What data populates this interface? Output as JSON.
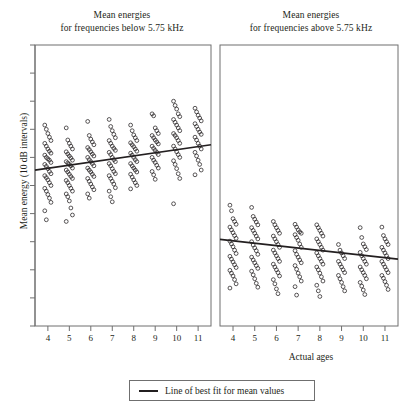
{
  "figure": {
    "y_axis_label": "Mean energy (10 dB intervals)",
    "x_axis_label": "Actual ages",
    "legend": {
      "label": "Line of best fit for mean values",
      "line_color": "#231f20"
    }
  },
  "panels": {
    "left": {
      "title_line1": "Mean energies",
      "title_line2": "for frequencies below 5.75 kHz"
    },
    "right": {
      "title_line1": "Mean energies",
      "title_line2": "for frequencies above 5.75 kHz"
    }
  },
  "chart_data": {
    "type": "scatter",
    "xlabel": "Actual ages",
    "ylabel": "Mean energy (10 dB intervals)",
    "xlim": [
      3.4,
      11.6
    ],
    "ylim": [
      0,
      10
    ],
    "xticks": [
      4,
      5,
      6,
      7,
      8,
      9,
      10,
      11
    ],
    "yticks": [
      0,
      1,
      2,
      3,
      4,
      5,
      6,
      7,
      8,
      9,
      10
    ],
    "ytick_labels": [],
    "grid": false,
    "legend_position": "bottom-center",
    "marker": "open-circle",
    "marker_color": "#231f20",
    "panels": [
      {
        "name": "below-5.75-kHz",
        "title": "Mean energies for frequencies below 5.75 kHz",
        "fit_line": {
          "label": "Line of best fit for mean values",
          "x_start": 3.4,
          "y_start": 5.55,
          "x_end": 11.6,
          "y_end": 6.45,
          "slope": 0.11,
          "intercept": 5.18
        },
        "series": [
          {
            "x": 4,
            "values": [
              7.15,
              7.0,
              6.85,
              6.72,
              6.6,
              6.5,
              6.4,
              6.3,
              6.22,
              6.15,
              6.08,
              6.0,
              5.95,
              5.9,
              5.82,
              5.75,
              5.68,
              5.6,
              5.5,
              5.42,
              5.35,
              5.28,
              5.2,
              5.1,
              5.0,
              4.9,
              4.8,
              4.68,
              4.55,
              4.4,
              4.1,
              3.78
            ]
          },
          {
            "x": 5,
            "values": [
              7.05,
              6.62,
              6.5,
              6.4,
              6.3,
              6.2,
              6.12,
              6.05,
              5.98,
              5.9,
              5.85,
              5.8,
              5.75,
              5.7,
              5.62,
              5.55,
              5.48,
              5.4,
              5.32,
              5.25,
              5.18,
              5.1,
              5.0,
              4.9,
              4.8,
              4.7,
              4.6,
              4.45,
              4.2,
              3.95,
              3.72
            ]
          },
          {
            "x": 6,
            "values": [
              7.28,
              6.78,
              6.65,
              6.55,
              6.45,
              6.35,
              6.28,
              6.2,
              6.12,
              6.05,
              6.0,
              5.92,
              5.85,
              5.78,
              5.7,
              5.62,
              5.55,
              5.48,
              5.4,
              5.32,
              5.25,
              5.15,
              5.05,
              4.95,
              4.85,
              4.7,
              4.55
            ]
          },
          {
            "x": 7,
            "values": [
              7.35,
              7.1,
              6.95,
              6.82,
              6.7,
              6.6,
              6.5,
              6.4,
              6.32,
              6.25,
              6.18,
              6.1,
              6.0,
              5.92,
              5.85,
              5.78,
              5.7,
              5.6,
              5.5,
              5.42,
              5.35,
              5.25,
              5.15,
              5.05,
              4.92,
              4.8,
              4.6,
              4.42
            ]
          },
          {
            "x": 8,
            "values": [
              7.15,
              6.95,
              6.8,
              6.7,
              6.6,
              6.52,
              6.45,
              6.38,
              6.3,
              6.22,
              6.15,
              6.08,
              6.0,
              5.92,
              5.85,
              5.78,
              5.7,
              5.62,
              5.55,
              5.48,
              5.4,
              5.3,
              5.2,
              5.1,
              5.0,
              4.88
            ]
          },
          {
            "x": 9,
            "values": [
              7.55,
              7.48,
              7.05,
              6.95,
              6.85,
              6.78,
              6.7,
              6.62,
              6.55,
              6.48,
              6.4,
              6.32,
              6.25,
              6.18,
              6.1,
              6.0,
              5.9,
              5.82,
              5.72,
              5.62,
              5.5,
              5.38,
              5.22
            ]
          },
          {
            "x": 10,
            "values": [
              8.0,
              7.85,
              7.72,
              7.55,
              7.45,
              7.35,
              7.25,
              7.15,
              7.05,
              6.95,
              6.85,
              6.78,
              6.7,
              6.6,
              6.5,
              6.4,
              6.3,
              6.2,
              6.1,
              6.0,
              5.88,
              5.75,
              5.6,
              5.42,
              5.25,
              4.35
            ]
          },
          {
            "x": 11,
            "values": [
              7.75,
              7.62,
              7.5,
              7.4,
              7.3,
              7.2,
              7.1,
              7.0,
              6.9,
              6.82,
              6.72,
              6.62,
              6.5,
              6.4,
              6.3,
              6.18,
              6.05,
              5.9,
              5.75,
              5.55,
              5.38
            ]
          }
        ]
      },
      {
        "name": "above-5.75-kHz",
        "title": "Mean energies for frequencies above 5.75 kHz",
        "fit_line": {
          "label": "Line of best fit for mean values",
          "x_start": 3.4,
          "y_start": 3.08,
          "x_end": 11.6,
          "y_end": 2.38,
          "slope": -0.085,
          "intercept": 3.37
        },
        "series": [
          {
            "x": 4,
            "values": [
              4.3,
              4.1,
              3.82,
              3.72,
              3.62,
              3.52,
              3.42,
              3.32,
              3.22,
              3.12,
              3.02,
              2.92,
              2.82,
              2.7,
              2.58,
              2.48,
              2.38,
              2.28,
              2.18,
              2.08,
              1.98,
              1.88,
              1.78,
              1.65,
              1.5,
              1.35
            ]
          },
          {
            "x": 5,
            "values": [
              4.22,
              3.9,
              3.8,
              3.7,
              3.6,
              3.5,
              3.4,
              3.3,
              3.2,
              3.1,
              3.0,
              2.88,
              2.78,
              2.68,
              2.55,
              2.45,
              2.35,
              2.25,
              2.15,
              2.05,
              1.95,
              1.82,
              1.68,
              1.52,
              1.38
            ]
          },
          {
            "x": 6,
            "values": [
              3.72,
              3.6,
              3.5,
              3.4,
              3.3,
              3.2,
              3.1,
              3.0,
              2.9,
              2.8,
              2.7,
              2.6,
              2.5,
              2.4,
              2.3,
              2.2,
              2.1,
              2.0,
              1.9,
              1.78,
              1.65,
              1.5,
              1.32,
              1.15
            ]
          },
          {
            "x": 7,
            "values": [
              3.62,
              3.52,
              3.42,
              3.35,
              3.3,
              3.25,
              3.15,
              3.05,
              2.92,
              2.8,
              2.68,
              2.55,
              2.45,
              2.35,
              2.25,
              2.15,
              2.02,
              1.88,
              1.75,
              1.6,
              1.4,
              1.1
            ]
          },
          {
            "x": 8,
            "values": [
              3.6,
              3.5,
              3.4,
              3.3,
              3.2,
              3.1,
              3.0,
              2.9,
              2.8,
              2.7,
              2.6,
              2.5,
              2.4,
              2.3,
              2.2,
              2.1,
              2.0,
              1.88,
              1.75,
              1.6,
              1.45,
              1.25,
              1.05
            ]
          },
          {
            "x": 9,
            "values": [
              2.9,
              2.7,
              2.6,
              2.5,
              2.4,
              2.3,
              2.2,
              2.1,
              2.0,
              1.9,
              1.8,
              1.68,
              1.55,
              1.4,
              1.25
            ]
          },
          {
            "x": 10,
            "values": [
              3.5,
              3.15,
              2.92,
              2.82,
              2.72,
              2.62,
              2.5,
              2.4,
              2.3,
              2.2,
              2.1,
              2.0,
              1.9,
              1.8,
              1.68,
              1.55,
              1.42,
              1.28,
              1.12
            ]
          },
          {
            "x": 11,
            "values": [
              3.52,
              3.22,
              3.1,
              3.0,
              2.9,
              2.8,
              2.7,
              2.6,
              2.5,
              2.4,
              2.3,
              2.2,
              2.1,
              2.0,
              1.9,
              1.8,
              1.7,
              1.58,
              1.45,
              1.3
            ]
          }
        ]
      }
    ]
  }
}
